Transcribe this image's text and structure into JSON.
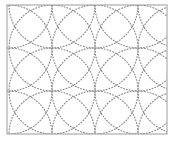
{
  "figure": {
    "kind": "geometric-line-diagram",
    "canvas": {
      "width": 187,
      "height": 143,
      "background_color": "#ffffff"
    },
    "frame": {
      "name": "border-frame",
      "x": 7,
      "y": 5,
      "width": 160,
      "height": 129,
      "stroke_color": "#9a9a9a",
      "stroke_width": 1,
      "fill_color": "#ffffff"
    },
    "stroke": {
      "color": "#8c8c8c",
      "width": 1.15,
      "style": "dotted",
      "dash_array": "0.9 2.0",
      "line_cap": "round"
    },
    "lattice": {
      "description": "Circle centres sit on a square lattice; each circle passes through its four neighbouring centres.",
      "x_positions": [
        9,
        52,
        95,
        138,
        181
      ],
      "y_positions": [
        5,
        48,
        91,
        134
      ],
      "x_spacing": 43,
      "y_spacing": 43,
      "radius": 43
    },
    "circles": [
      {
        "cx": 9,
        "cy": 5,
        "r": 43
      },
      {
        "cx": 52,
        "cy": 5,
        "r": 43
      },
      {
        "cx": 95,
        "cy": 5,
        "r": 43
      },
      {
        "cx": 138,
        "cy": 5,
        "r": 43
      },
      {
        "cx": 181,
        "cy": 5,
        "r": 43
      },
      {
        "cx": 9,
        "cy": 48,
        "r": 43
      },
      {
        "cx": 52,
        "cy": 48,
        "r": 43
      },
      {
        "cx": 95,
        "cy": 48,
        "r": 43
      },
      {
        "cx": 138,
        "cy": 48,
        "r": 43
      },
      {
        "cx": 181,
        "cy": 48,
        "r": 43
      },
      {
        "cx": 9,
        "cy": 91,
        "r": 43
      },
      {
        "cx": 52,
        "cy": 91,
        "r": 43
      },
      {
        "cx": 95,
        "cy": 91,
        "r": 43
      },
      {
        "cx": 138,
        "cy": 91,
        "r": 43
      },
      {
        "cx": 181,
        "cy": 91,
        "r": 43
      },
      {
        "cx": 9,
        "cy": 134,
        "r": 43
      },
      {
        "cx": 52,
        "cy": 134,
        "r": 43
      },
      {
        "cx": 95,
        "cy": 134,
        "r": 43
      },
      {
        "cx": 138,
        "cy": 134,
        "r": 43
      },
      {
        "cx": 181,
        "cy": 134,
        "r": 43
      }
    ]
  }
}
